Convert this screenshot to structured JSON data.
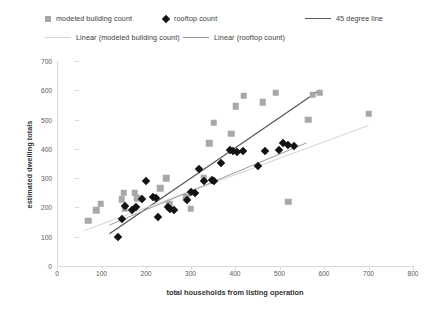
{
  "legend": {
    "modeled_label": "modeled building count",
    "rooftop_label": "rooftop count",
    "line45_label": "45 degree line",
    "linear_modeled_label": "Linear (modeled building count)",
    "linear_rooftop_label": "Linear (rooftop count)",
    "modeled_marker": "gray-square-marker",
    "rooftop_marker": "black-diamond-marker",
    "line45_marker": "dark-line-swatch",
    "linear_modeled_marker": "light-line-swatch",
    "linear_rooftop_marker": "mid-line-swatch"
  },
  "colors": {
    "modeled_series": "#a8a8a8",
    "rooftop_series": "#121212",
    "line_45": "#595959",
    "trend_modeled": "#d4d4d4",
    "trend_rooftop": "#9a9a9a",
    "axis": "#d9d9d9",
    "text": "#3a3a3a"
  },
  "chart_data": {
    "type": "scatter",
    "title": "",
    "xlabel": "total households from listing operation",
    "ylabel": "estimated dwelling totals",
    "xlim": [
      0,
      800
    ],
    "ylim": [
      0,
      700
    ],
    "xticks": [
      0,
      100,
      200,
      300,
      400,
      500,
      600,
      700,
      800
    ],
    "yticks": [
      0,
      100,
      200,
      300,
      400,
      500,
      600,
      700
    ],
    "grid": false,
    "legend_position": "top",
    "series": [
      {
        "name": "modeled building count",
        "marker": "square",
        "color": "#a8a8a8",
        "points": [
          [
            70,
            155
          ],
          [
            88,
            190
          ],
          [
            98,
            212
          ],
          [
            145,
            228
          ],
          [
            150,
            250
          ],
          [
            152,
            196
          ],
          [
            175,
            250
          ],
          [
            180,
            232
          ],
          [
            232,
            265
          ],
          [
            246,
            300
          ],
          [
            252,
            212
          ],
          [
            290,
            236
          ],
          [
            300,
            196
          ],
          [
            330,
            300
          ],
          [
            342,
            420
          ],
          [
            352,
            490
          ],
          [
            392,
            452
          ],
          [
            402,
            545
          ],
          [
            420,
            582
          ],
          [
            462,
            560
          ],
          [
            492,
            592
          ],
          [
            520,
            220
          ],
          [
            565,
            500
          ],
          [
            575,
            585
          ],
          [
            590,
            592
          ],
          [
            700,
            520
          ]
        ]
      },
      {
        "name": "rooftop count",
        "marker": "diamond",
        "color": "#121212",
        "points": [
          [
            136,
            100
          ],
          [
            146,
            162
          ],
          [
            152,
            205
          ],
          [
            168,
            190
          ],
          [
            178,
            200
          ],
          [
            192,
            228
          ],
          [
            200,
            290
          ],
          [
            215,
            235
          ],
          [
            222,
            232
          ],
          [
            228,
            168
          ],
          [
            250,
            200
          ],
          [
            254,
            196
          ],
          [
            262,
            192
          ],
          [
            292,
            226
          ],
          [
            300,
            252
          ],
          [
            310,
            250
          ],
          [
            318,
            330
          ],
          [
            330,
            290
          ],
          [
            348,
            292
          ],
          [
            352,
            290
          ],
          [
            368,
            352
          ],
          [
            388,
            396
          ],
          [
            396,
            392
          ],
          [
            404,
            390
          ],
          [
            418,
            392
          ],
          [
            452,
            342
          ],
          [
            468,
            394
          ],
          [
            498,
            396
          ],
          [
            508,
            420
          ],
          [
            520,
            412
          ],
          [
            532,
            410
          ]
        ]
      }
    ],
    "trendlines": [
      {
        "name": "45 degree line",
        "color": "#595959",
        "x0": 118,
        "y0": 110,
        "x1": 590,
        "y1": 600
      },
      {
        "name": "Linear (modeled building count)",
        "color": "#d4d4d4",
        "x0": 60,
        "y0": 120,
        "x1": 700,
        "y1": 480
      },
      {
        "name": "Linear (rooftop count)",
        "color": "#9a9a9a",
        "x0": 118,
        "y0": 140,
        "x1": 560,
        "y1": 420
      }
    ]
  }
}
